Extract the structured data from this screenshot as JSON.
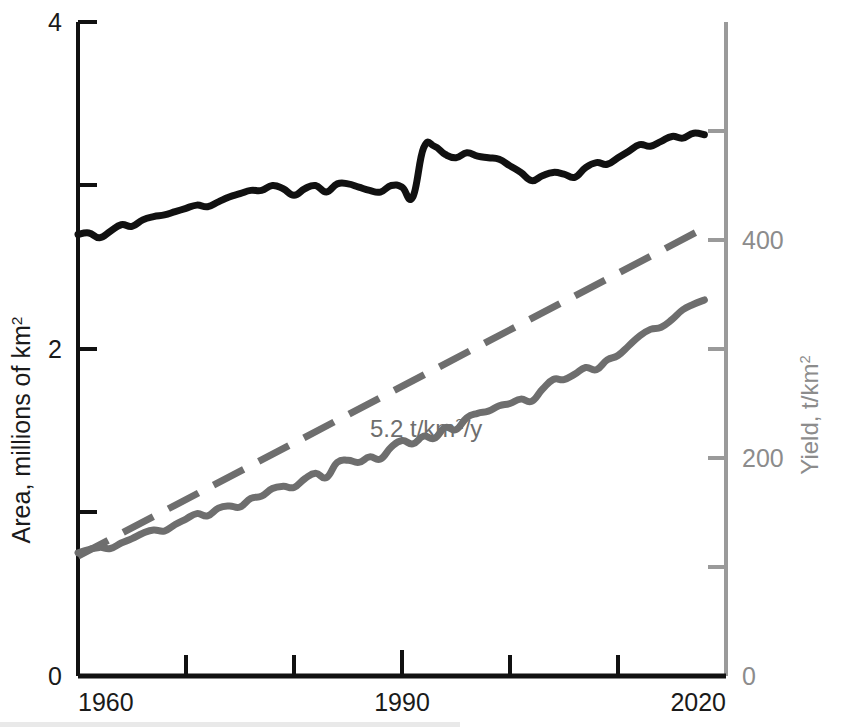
{
  "chart_data": {
    "type": "line",
    "title": "",
    "xlabel": "",
    "xlim": [
      1960,
      2020
    ],
    "x_ticks": [
      1960,
      1970,
      1980,
      1990,
      2000,
      2010,
      2020
    ],
    "x_tick_labels": [
      "1960",
      "",
      "",
      "1990",
      "",
      "",
      "2020"
    ],
    "axes": [
      {
        "id": "left",
        "label": "Area, millions of km",
        "label_superscript": "2",
        "color": "#1a1a1a",
        "ylim": [
          0,
          4
        ],
        "y_ticks": [
          0,
          1,
          2,
          3,
          4
        ],
        "y_tick_labels": [
          "0",
          "",
          "2",
          "",
          "4"
        ]
      },
      {
        "id": "right",
        "label": "Yield, t/km",
        "label_superscript": "2",
        "color": "#8c8c8c",
        "ylim": [
          0,
          600
        ],
        "y_ticks": [
          0,
          100,
          200,
          300,
          400,
          500,
          600
        ],
        "y_tick_labels": [
          "0",
          "",
          "200",
          "",
          "400",
          "",
          ""
        ]
      }
    ],
    "grid": false,
    "legend": "none",
    "annotations": [
      {
        "id": "trend-rate",
        "text": "5.2 t/km",
        "superscript": "2",
        "text_tail": "/y",
        "color": "#6e6e6e",
        "x": 1991,
        "y_right": 255
      }
    ],
    "series": [
      {
        "name": "Area",
        "axis": "left",
        "color": "#111111",
        "style": "solid",
        "width": 7,
        "units": "millions of km2",
        "x": [
          1960,
          1961,
          1962,
          1963,
          1964,
          1965,
          1966,
          1967,
          1968,
          1969,
          1970,
          1971,
          1972,
          1973,
          1974,
          1975,
          1976,
          1977,
          1978,
          1979,
          1980,
          1981,
          1982,
          1983,
          1984,
          1985,
          1986,
          1987,
          1988,
          1989,
          1990,
          1991,
          1992,
          1993,
          1994,
          1995,
          1996,
          1997,
          1998,
          1999,
          2000,
          2001,
          2002,
          2003,
          2004,
          2005,
          2006,
          2007,
          2008,
          2009,
          2010,
          2011,
          2012,
          2013,
          2014,
          2015,
          2016,
          2017,
          2018
        ],
        "values": [
          2.7,
          2.71,
          2.68,
          2.72,
          2.76,
          2.75,
          2.79,
          2.81,
          2.82,
          2.84,
          2.86,
          2.88,
          2.87,
          2.9,
          2.93,
          2.95,
          2.97,
          2.97,
          3.0,
          2.98,
          2.94,
          2.98,
          3.0,
          2.96,
          3.01,
          3.01,
          2.99,
          2.97,
          2.96,
          3.0,
          2.99,
          2.93,
          3.23,
          3.24,
          3.19,
          3.17,
          3.2,
          3.18,
          3.17,
          3.16,
          3.12,
          3.08,
          3.03,
          3.06,
          3.08,
          3.07,
          3.05,
          3.11,
          3.14,
          3.13,
          3.17,
          3.21,
          3.25,
          3.24,
          3.27,
          3.3,
          3.29,
          3.32,
          3.31
        ]
      },
      {
        "name": "Yield",
        "axis": "right",
        "color": "#6e6e6e",
        "style": "solid",
        "width": 7,
        "units": "t/km2",
        "x": [
          1960,
          1961,
          1962,
          1963,
          1964,
          1965,
          1966,
          1967,
          1968,
          1969,
          1970,
          1971,
          1972,
          1973,
          1974,
          1975,
          1976,
          1977,
          1978,
          1979,
          1980,
          1981,
          1982,
          1983,
          1984,
          1985,
          1986,
          1987,
          1988,
          1989,
          1990,
          1991,
          1992,
          1993,
          1994,
          1995,
          1996,
          1997,
          1998,
          1999,
          2000,
          2001,
          2002,
          2003,
          2004,
          2005,
          2006,
          2007,
          2008,
          2009,
          2010,
          2011,
          2012,
          2013,
          2014,
          2015,
          2016,
          2017,
          2018
        ],
        "values": [
          113,
          116,
          118,
          117,
          122,
          126,
          131,
          134,
          133,
          139,
          144,
          149,
          147,
          154,
          156,
          155,
          163,
          165,
          172,
          174,
          173,
          181,
          186,
          182,
          196,
          198,
          196,
          201,
          199,
          210,
          216,
          213,
          220,
          218,
          228,
          226,
          237,
          241,
          243,
          248,
          250,
          254,
          252,
          263,
          272,
          272,
          277,
          283,
          281,
          290,
          294,
          303,
          312,
          318,
          320,
          327,
          336,
          341,
          345
        ],
        "overlay_trend": {
          "name": "Linear trend 5.2 t/km2/y",
          "style": "dashed",
          "color": "#6e6e6e",
          "width": 7,
          "slope_per_year": 5.2,
          "x": [
            1960,
            2018
          ],
          "values": [
            110,
            411
          ]
        }
      }
    ]
  },
  "caption": {
    "partial_text_cut_off": ""
  }
}
